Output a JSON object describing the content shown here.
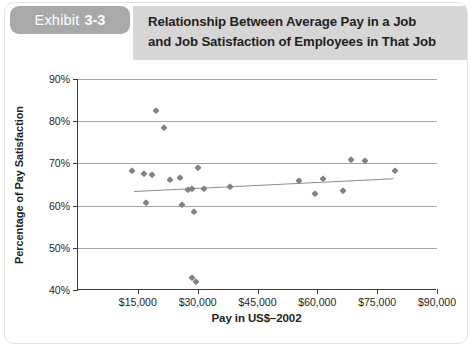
{
  "header": {
    "exhibit_word": "Exhibit",
    "exhibit_number": "3-3",
    "title_line1": "Relationship Between Average Pay in a Job",
    "title_line2": "and Job Satisfaction of Employees in That Job",
    "chip_color": "#a9a9a9",
    "band_color": "#d6d6d6",
    "title_color": "#231f20"
  },
  "chart_data": {
    "type": "scatter",
    "title": "Relationship Between Average Pay in a Job and Job Satisfaction of Employees in That Job",
    "xlabel": "Pay in US$–2002",
    "ylabel": "Percentage of Pay Satisfaction",
    "xlim": [
      0,
      90000
    ],
    "ylim": [
      40,
      90
    ],
    "xticks": [
      0,
      15000,
      30000,
      45000,
      60000,
      75000,
      90000
    ],
    "xticklabels": [
      "",
      "$15,000",
      "$30,000",
      "$45,000",
      "$60,000",
      "$75,000",
      "$90,000"
    ],
    "yticks": [
      40,
      50,
      60,
      70,
      80,
      90
    ],
    "yticklabels": [
      "40%",
      "50%",
      "60%",
      "70%",
      "80%",
      "90%"
    ],
    "grid": "horizontal",
    "legend": "none",
    "marker": "diamond",
    "marker_color": "#808285",
    "points": [
      {
        "x": 13500,
        "y": 68.3
      },
      {
        "x": 16500,
        "y": 67.5
      },
      {
        "x": 17000,
        "y": 60.6
      },
      {
        "x": 18500,
        "y": 67.3
      },
      {
        "x": 19500,
        "y": 82.5
      },
      {
        "x": 21500,
        "y": 78.5
      },
      {
        "x": 23000,
        "y": 66.1
      },
      {
        "x": 25500,
        "y": 66.6
      },
      {
        "x": 26000,
        "y": 60.2
      },
      {
        "x": 27500,
        "y": 63.8
      },
      {
        "x": 28500,
        "y": 63.9
      },
      {
        "x": 28500,
        "y": 42.9
      },
      {
        "x": 29000,
        "y": 58.5
      },
      {
        "x": 29500,
        "y": 42.0
      },
      {
        "x": 30000,
        "y": 69.0
      },
      {
        "x": 31500,
        "y": 64.0
      },
      {
        "x": 38000,
        "y": 64.5
      },
      {
        "x": 55500,
        "y": 65.9
      },
      {
        "x": 59500,
        "y": 62.7
      },
      {
        "x": 61500,
        "y": 66.3
      },
      {
        "x": 66500,
        "y": 63.5
      },
      {
        "x": 68500,
        "y": 70.7
      },
      {
        "x": 72000,
        "y": 70.6
      },
      {
        "x": 79500,
        "y": 68.3
      }
    ],
    "trendline": {
      "label": "linear fit",
      "color": "#8e8e8e",
      "x_start": 14000,
      "y_start": 63.5,
      "x_end": 79000,
      "y_end": 66.5
    },
    "axis_color": "#3a3a3a",
    "gridline_color": "#a6a6a6"
  }
}
